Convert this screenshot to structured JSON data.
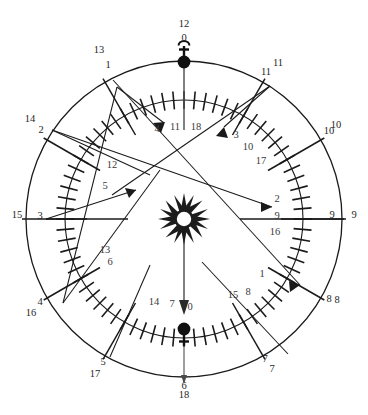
{
  "figure": {
    "type": "astronomical-circle-diagram",
    "title": "",
    "center": {
      "x": 184,
      "y": 219
    },
    "outer_radius": 158,
    "inner_radius": 119,
    "colors": {
      "stroke": "#1a1a1a",
      "label": "#262626",
      "inner_label": "#3a3a3a",
      "background": "#ffffff"
    }
  },
  "symbols": {
    "center": {
      "name": "sun-symbol",
      "label": ""
    },
    "top": {
      "name": "mercury-symbol",
      "label": ""
    },
    "bottom": {
      "name": "venus-symbol",
      "label": ""
    }
  },
  "axis_labels": {
    "top_outer": "12",
    "top_inner": "0",
    "bottom_inner": "6",
    "bottom_outer": "18",
    "left_outer": "15",
    "left_inner": "3",
    "right_outer": "9",
    "bottom_center_inner": "0"
  },
  "outer_labels": [
    {
      "text": "12",
      "x": 184,
      "y": 27
    },
    {
      "text": "13",
      "x": 99,
      "y": 53
    },
    {
      "text": "11",
      "x": 278,
      "y": 66
    },
    {
      "text": "14",
      "x": 30,
      "y": 122
    },
    {
      "text": "10",
      "x": 336,
      "y": 128
    },
    {
      "text": "15",
      "x": 17,
      "y": 218
    },
    {
      "text": "9",
      "x": 354,
      "y": 218
    },
    {
      "text": "16",
      "x": 31,
      "y": 316
    },
    {
      "text": "8",
      "x": 337,
      "y": 303
    },
    {
      "text": "17",
      "x": 95,
      "y": 377
    },
    {
      "text": "7",
      "x": 272,
      "y": 372
    },
    {
      "text": "18",
      "x": 184,
      "y": 398
    }
  ],
  "ring_labels": [
    {
      "text": "0",
      "x": 184,
      "y": 41
    },
    {
      "text": "1",
      "x": 108,
      "y": 68
    },
    {
      "text": "2",
      "x": 41,
      "y": 133
    },
    {
      "text": "3",
      "x": 40,
      "y": 219
    },
    {
      "text": "4",
      "x": 40,
      "y": 305
    },
    {
      "text": "5",
      "x": 103,
      "y": 365
    },
    {
      "text": "6",
      "x": 184,
      "y": 389
    },
    {
      "text": "7",
      "x": 265,
      "y": 362
    },
    {
      "text": "8",
      "x": 329,
      "y": 302
    },
    {
      "text": "9",
      "x": 332,
      "y": 218
    },
    {
      "text": "10",
      "x": 329,
      "y": 134
    },
    {
      "text": "11",
      "x": 266,
      "y": 75
    }
  ],
  "inner_labels": [
    {
      "text": "4",
      "x": 157,
      "y": 132
    },
    {
      "text": "11",
      "x": 175,
      "y": 130
    },
    {
      "text": "18",
      "x": 196,
      "y": 130
    },
    {
      "text": "3",
      "x": 236,
      "y": 138
    },
    {
      "text": "10",
      "x": 248,
      "y": 150
    },
    {
      "text": "17",
      "x": 261,
      "y": 164
    },
    {
      "text": "2",
      "x": 277,
      "y": 202
    },
    {
      "text": "9",
      "x": 277,
      "y": 219
    },
    {
      "text": "16",
      "x": 275,
      "y": 235
    },
    {
      "text": "1",
      "x": 262,
      "y": 277
    },
    {
      "text": "8",
      "x": 248,
      "y": 295
    },
    {
      "text": "15",
      "x": 233,
      "y": 298
    },
    {
      "text": "0",
      "x": 190,
      "y": 310
    },
    {
      "text": "7",
      "x": 172,
      "y": 307
    },
    {
      "text": "14",
      "x": 154,
      "y": 305
    },
    {
      "text": "6",
      "x": 110,
      "y": 265
    },
    {
      "text": "13",
      "x": 105,
      "y": 253
    },
    {
      "text": "5",
      "x": 105,
      "y": 189
    },
    {
      "text": "12",
      "x": 112,
      "y": 168
    }
  ],
  "tick_marks": {
    "count": 72,
    "label": "graduated-scale-ticks"
  },
  "sight_lines": [
    {
      "name": "sight-line-1",
      "from": "1",
      "to": "2",
      "arrow": true
    },
    {
      "name": "sight-line-2",
      "from": "2",
      "to": "3",
      "arrow": true
    },
    {
      "name": "sight-line-3",
      "from": "11",
      "to": "4",
      "arrow": true
    },
    {
      "name": "sight-line-4",
      "from": "15",
      "to": "inner-left",
      "arrow": true
    },
    {
      "name": "sight-line-5",
      "from": "1",
      "to": "16",
      "arrow": false
    },
    {
      "name": "sight-line-6",
      "from": "13",
      "to": "8",
      "arrow": true
    }
  ],
  "center_arrow": {
    "name": "center-down-arrow",
    "direction": "down"
  },
  "chart_data": {
    "type": "scatter",
    "title": "",
    "xlabel": "",
    "ylabel": "",
    "categories": [
      "0",
      "1",
      "2",
      "3",
      "4",
      "5",
      "6",
      "7",
      "8",
      "9",
      "10",
      "11"
    ],
    "values": [
      12,
      13,
      14,
      15,
      16,
      17,
      18,
      7,
      8,
      9,
      10,
      11
    ],
    "legend": []
  }
}
